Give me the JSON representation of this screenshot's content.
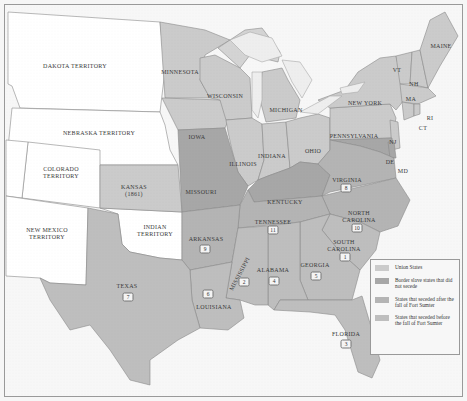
{
  "colors": {
    "union": "#cbcbcb",
    "border": "#a7a7a7",
    "seceded_after": "#b4b4b4",
    "seceded_before": "#bebebe",
    "territory": "#ffffff",
    "water": "#f6f6f6",
    "lakes": "#eeeeee"
  },
  "territories": {
    "dakota": "DAKOTA TERRITORY",
    "nebraska": "NEBRASKA TERRITORY",
    "colorado_1": "COLORADO",
    "colorado_2": "TERRITORY",
    "new_mexico_1": "NEW MEXICO",
    "new_mexico_2": "TERRITORY",
    "indian_1": "INDIAN",
    "indian_2": "TERRITORY"
  },
  "union_states": {
    "minnesota": "MINNESOTA",
    "wisconsin": "WISCONSIN",
    "michigan": "MICHIGAN",
    "iowa": "IOWA",
    "illinois": "ILLINOIS",
    "indiana": "INDIANA",
    "ohio": "OHIO",
    "pennsylvania": "PENNSYLVANIA",
    "new_york": "NEW YORK",
    "kansas_1": "KANSAS",
    "kansas_2": "(1861)",
    "maine": "MAINE",
    "vt": "VT",
    "nh": "NH",
    "ma": "MA",
    "ri": "RI",
    "ct": "CT",
    "nj": "NJ"
  },
  "border_states": {
    "missouri": "MISSOURI",
    "kentucky": "KENTUCKY",
    "de": "DE",
    "md": "MD"
  },
  "seceded_after": {
    "virginia": {
      "name": "VIRGINIA",
      "order": "8"
    },
    "north_carolina_1": "NORTH",
    "north_carolina_2": "CAROLINA",
    "north_carolina_order": "10",
    "tennessee": {
      "name": "TENNESSEE",
      "order": "11"
    },
    "arkansas": {
      "name": "ARKANSAS",
      "order": "9"
    }
  },
  "seceded_before": {
    "south_carolina_1": "SOUTH",
    "south_carolina_2": "CAROLINA",
    "south_carolina_order": "1",
    "mississippi": {
      "name": "MISSISSIPPI",
      "order": "2"
    },
    "florida": {
      "name": "FLORIDA",
      "order": "3"
    },
    "alabama": {
      "name": "ALABAMA",
      "order": "4"
    },
    "georgia": {
      "name": "GEORGIA",
      "order": "5"
    },
    "louisiana": {
      "name": "LOUISIANA",
      "order": "6"
    },
    "texas": {
      "name": "TEXAS",
      "order": "7"
    }
  },
  "legend": {
    "items": [
      {
        "label": "Union States"
      },
      {
        "label": "Border slave states that did not secede"
      },
      {
        "label": "States that seceded after the fall of Fort Sumter"
      },
      {
        "label": "States that seceded before the fall of Fort Sumter"
      }
    ]
  }
}
